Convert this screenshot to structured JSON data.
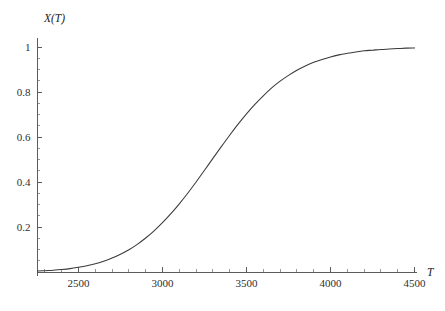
{
  "chart_data": {
    "type": "line",
    "title": "",
    "subtitle": "",
    "xlabel": "T",
    "ylabel": "X(T)",
    "xlim": [
      2256,
      4500
    ],
    "ylim": [
      0,
      1.02
    ],
    "grid": false,
    "legend": null,
    "x_ticks": [
      2500,
      3000,
      3500,
      4000,
      4500
    ],
    "x_tick_labels": [
      "2500",
      "3000",
      "3500",
      "4000",
      "4500"
    ],
    "x_minor_step": 100,
    "y_ticks": [
      0.2,
      0.4,
      0.6,
      0.8,
      1
    ],
    "y_tick_labels": [
      "0.2",
      "0.4",
      "0.6",
      "0.8",
      "1"
    ],
    "y_minor_step": 0.05,
    "line_color": "#3a3a3a",
    "axis_color": "#4a4a4a",
    "background_color": "#ffffff",
    "series": [
      {
        "name": "X(T)",
        "x": [
          2256,
          2300,
          2350,
          2400,
          2450,
          2500,
          2550,
          2600,
          2650,
          2700,
          2750,
          2800,
          2850,
          2900,
          2950,
          3000,
          3050,
          3100,
          3150,
          3200,
          3250,
          3300,
          3350,
          3400,
          3450,
          3500,
          3550,
          3600,
          3650,
          3700,
          3750,
          3800,
          3850,
          3900,
          3950,
          4000,
          4050,
          4100,
          4150,
          4200,
          4250,
          4300,
          4350,
          4400,
          4450,
          4500
        ],
        "y": [
          0.004,
          0.006,
          0.008,
          0.011,
          0.015,
          0.021,
          0.028,
          0.037,
          0.048,
          0.062,
          0.079,
          0.099,
          0.123,
          0.151,
          0.183,
          0.219,
          0.259,
          0.303,
          0.35,
          0.4,
          0.452,
          0.505,
          0.557,
          0.608,
          0.657,
          0.703,
          0.745,
          0.783,
          0.818,
          0.848,
          0.874,
          0.897,
          0.916,
          0.932,
          0.945,
          0.956,
          0.965,
          0.972,
          0.978,
          0.983,
          0.986,
          0.989,
          0.991,
          0.993,
          0.995,
          0.996
        ]
      }
    ]
  }
}
